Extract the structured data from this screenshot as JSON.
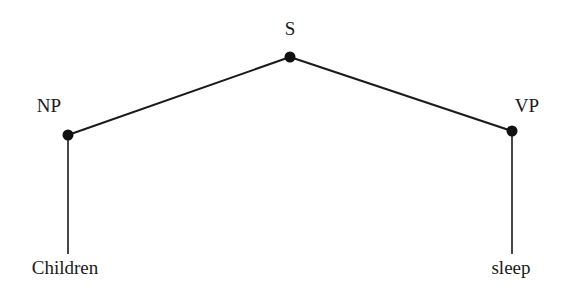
{
  "tree": {
    "root": {
      "id": "S",
      "label": "S"
    },
    "nodes": [
      {
        "id": "NP",
        "label": "NP",
        "parent": "S"
      },
      {
        "id": "VP",
        "label": "VP",
        "parent": "S"
      }
    ],
    "leaves": [
      {
        "id": "children",
        "label": "Children",
        "parent": "NP"
      },
      {
        "id": "sleep",
        "label": "sleep",
        "parent": "VP"
      }
    ]
  }
}
